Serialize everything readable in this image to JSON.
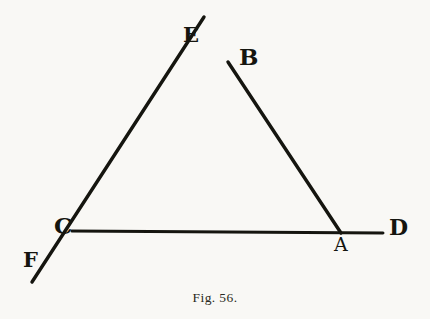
{
  "figure": {
    "caption": "Fig. 56.",
    "background_color": "#f9f8f5",
    "ink_color": "#15150f",
    "labels": {
      "E": "E",
      "B": "B",
      "C": "C",
      "F": "F",
      "A": "A",
      "D": "D"
    }
  },
  "chart_data": {
    "type": "diagram",
    "title": "Fig. 56.",
    "xlim": [
      0,
      430
    ],
    "ylim": [
      0,
      319
    ],
    "grid": false,
    "legend": null,
    "points": [
      {
        "name": "E",
        "x": 204,
        "y": 17,
        "label": "E",
        "label_x": 183,
        "label_y": 24,
        "kind": "ray-endpoint"
      },
      {
        "name": "B",
        "x": 228,
        "y": 62,
        "label": "B",
        "label_x": 239,
        "label_y": 45,
        "kind": "vertex"
      },
      {
        "name": "C",
        "x": 73,
        "y": 232,
        "label": "C",
        "label_x": 54,
        "label_y": 214,
        "kind": "vertex"
      },
      {
        "name": "F",
        "x": 32,
        "y": 282,
        "label": "F",
        "label_x": 23,
        "label_y": 249,
        "kind": "ray-endpoint"
      },
      {
        "name": "A",
        "x": 341,
        "y": 233,
        "label": "A",
        "label_x": 334,
        "label_y": 235,
        "kind": "vertex"
      },
      {
        "name": "D",
        "x": 383,
        "y": 233,
        "label": "D",
        "label_x": 389,
        "label_y": 216,
        "kind": "ray-endpoint"
      }
    ],
    "segments": [
      {
        "name": "line-F-to-E",
        "from": "F",
        "to": "E",
        "via": [
          "C",
          "B"
        ],
        "x1": 32,
        "y1": 282,
        "x2": 204,
        "y2": 17,
        "stroke_width": 3.4
      },
      {
        "name": "line-B-to-A",
        "from": "B",
        "to": "A",
        "x1": 228,
        "y1": 62,
        "x2": 341,
        "y2": 233,
        "stroke_width": 3.4
      },
      {
        "name": "line-C-to-D",
        "from": "C",
        "to": "D",
        "via": [
          "A"
        ],
        "x1": 72,
        "y1": 231,
        "x2": 383,
        "y2": 233,
        "stroke_width": 3.0
      }
    ],
    "label_font_sizes": {
      "E": 21,
      "B": 23,
      "C": 23,
      "F": 21,
      "A": 19,
      "D": 22
    }
  }
}
